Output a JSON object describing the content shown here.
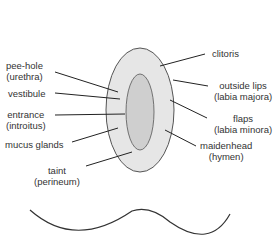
{
  "diagram": {
    "kind": "anatomical labeled illustration",
    "labels": [
      {
        "id": "clitoris",
        "lines": [
          "clitoris"
        ]
      },
      {
        "id": "urethra",
        "lines": [
          "pee-hole",
          "(urethra)"
        ]
      },
      {
        "id": "vestibule",
        "lines": [
          "vestibule"
        ]
      },
      {
        "id": "outer-lips",
        "lines": [
          "outside lips",
          "(labia majora)"
        ]
      },
      {
        "id": "entrance",
        "lines": [
          "entrance",
          "(introitus)"
        ]
      },
      {
        "id": "inner-lips",
        "lines": [
          "flaps",
          "(labia minora)"
        ]
      },
      {
        "id": "mucus-glands",
        "lines": [
          "mucus glands"
        ]
      },
      {
        "id": "hymen",
        "lines": [
          "maidenhead",
          "(hymen)"
        ]
      },
      {
        "id": "perineum",
        "lines": [
          "taint",
          "(perineum)"
        ]
      }
    ]
  },
  "colors": {
    "ink": "#333333",
    "background": "#ffffff"
  }
}
